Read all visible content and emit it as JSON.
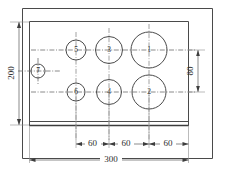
{
  "drawing": {
    "type": "engineering-part-drawing",
    "title": "Drilled plate layout",
    "plate": {
      "overall_width_label": "300",
      "overall_height_label": "200",
      "vertical_hole_pitch_label": "80",
      "units": "mm"
    },
    "dimensions": [
      {
        "id": "width-total",
        "label": "300",
        "orientation": "horizontal",
        "position": "bottom"
      },
      {
        "id": "pitch-1",
        "label": "60",
        "orientation": "horizontal",
        "position": "bottom"
      },
      {
        "id": "pitch-2",
        "label": "60",
        "orientation": "horizontal",
        "position": "bottom"
      },
      {
        "id": "pitch-3",
        "label": "60",
        "orientation": "horizontal",
        "position": "bottom"
      },
      {
        "id": "height-total",
        "label": "200",
        "orientation": "vertical",
        "position": "left"
      },
      {
        "id": "row-pitch",
        "label": "80",
        "orientation": "vertical",
        "position": "right"
      }
    ],
    "holes": [
      {
        "id": "hole-1",
        "label": "1",
        "size": "large",
        "row": "top",
        "column": "right"
      },
      {
        "id": "hole-2",
        "label": "2",
        "size": "large",
        "row": "bottom",
        "column": "right"
      },
      {
        "id": "hole-3",
        "label": "3",
        "size": "medium",
        "row": "top",
        "column": "middle"
      },
      {
        "id": "hole-4",
        "label": "4",
        "size": "medium",
        "row": "bottom",
        "column": "middle"
      },
      {
        "id": "hole-5",
        "label": "5",
        "size": "small",
        "row": "top",
        "column": "left"
      },
      {
        "id": "hole-6",
        "label": "6",
        "size": "small",
        "row": "bottom",
        "column": "left"
      },
      {
        "id": "hole-7",
        "label": "7",
        "size": "small",
        "row": "center",
        "column": "far-left"
      }
    ],
    "colors": {
      "object_line": "#4a4a4a",
      "center_line": "#6d6d6d",
      "dimension_line": "#5a5a5a",
      "text": "#2e2e2e",
      "background": "#ffffff"
    }
  }
}
